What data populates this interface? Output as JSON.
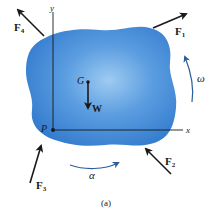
{
  "figure": {
    "caption": "(a)",
    "colors": {
      "body_fill": "#3f86d6",
      "body_highlight": "#8ec0ef",
      "arrow": "#1a1a1a",
      "axis": "#1a1a1a",
      "rotation_arrow": "#2a5d9a"
    },
    "axes": {
      "x_label": "x",
      "y_label": "y",
      "origin_label": "P"
    },
    "points": {
      "center_of_gravity": "G"
    },
    "forces": [
      {
        "id": "F1",
        "symbol": "F",
        "subscript": "1"
      },
      {
        "id": "F2",
        "symbol": "F",
        "subscript": "2"
      },
      {
        "id": "F3",
        "symbol": "F",
        "subscript": "3"
      },
      {
        "id": "F4",
        "symbol": "F",
        "subscript": "4"
      }
    ],
    "weight": {
      "label": "W"
    },
    "angular_velocity": {
      "label": "ω"
    },
    "angular_acceleration": {
      "label": "α"
    }
  }
}
